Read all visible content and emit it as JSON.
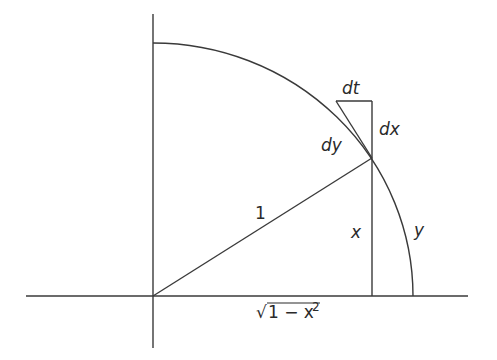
{
  "diagram": {
    "labels": {
      "dt": "dt",
      "dy": "dy",
      "dx": "dx",
      "radius": "1",
      "x": "x",
      "y": "y",
      "sqrt_symbol": "√",
      "sqrt_body": "1 − x",
      "sqrt_exponent": "2"
    },
    "colors": {
      "line": "#3a3a3a",
      "text": "#2a2a2a",
      "background": "#ffffff"
    }
  }
}
